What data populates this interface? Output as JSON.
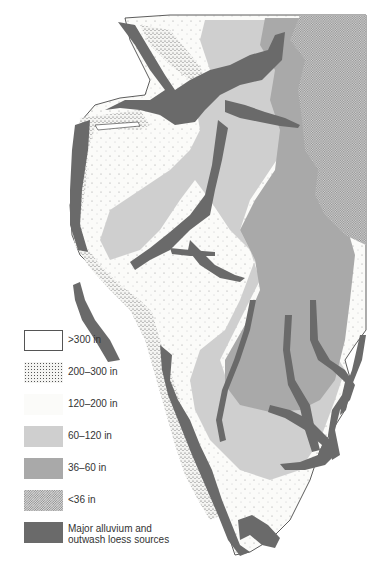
{
  "map": {
    "subject": "Loess thickness map with major alluvium and outwash loess sources",
    "colors": {
      "gt300": "#ffffff",
      "r200_300": "#f2f2f0",
      "r120_200": "#fafaf8",
      "r60_120": "#cfcfcf",
      "r36_60": "#a9a9a9",
      "lt36": "#bdbdbd",
      "sources": "#6a6a6a"
    }
  },
  "legend": {
    "items": [
      {
        "label": ">300 in",
        "pattern": "blank-outlined"
      },
      {
        "label": "200–300 in",
        "pattern": "dense-stipple"
      },
      {
        "label": "120–200 in",
        "pattern": "sparse-stipple"
      },
      {
        "label": "60–120 in",
        "pattern": "light-gray"
      },
      {
        "label": "36–60 in",
        "pattern": "medium-gray"
      },
      {
        "label": "<36 in",
        "pattern": "checker-dots"
      },
      {
        "label_line1": "Major alluvium and",
        "label_line2": "outwash loess sources",
        "pattern": "dark-gray"
      }
    ]
  }
}
